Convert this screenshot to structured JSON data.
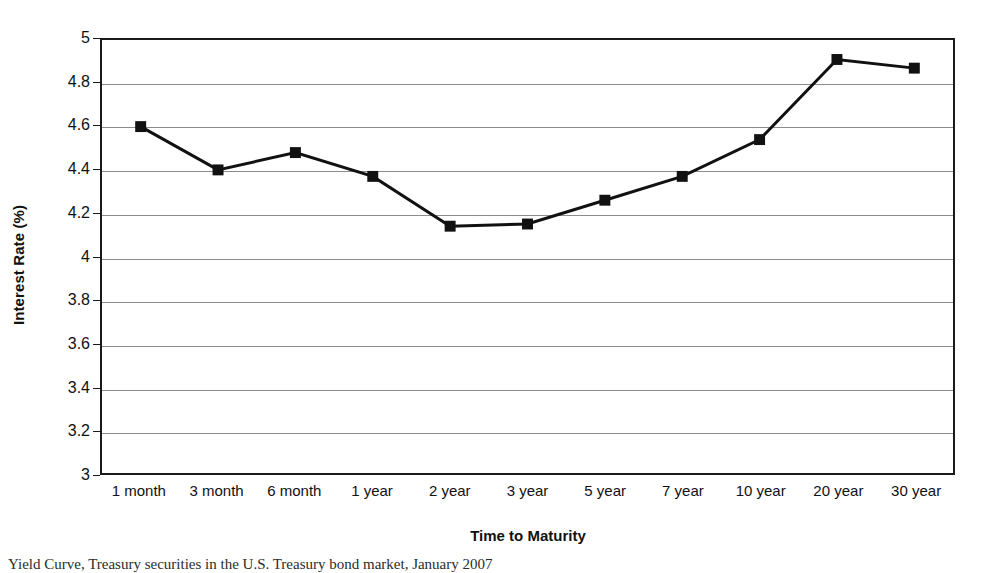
{
  "chart_data": {
    "type": "line",
    "title": "",
    "xlabel": "Time to Maturity",
    "ylabel": "Interest Rate (%)",
    "categories": [
      "1 month",
      "3 month",
      "6 month",
      "1 year",
      "2 year",
      "3 year",
      "5 year",
      "7 year",
      "10 year",
      "20 year",
      "30 year"
    ],
    "values": [
      4.6,
      4.4,
      4.48,
      4.37,
      4.14,
      4.15,
      4.26,
      4.37,
      4.54,
      4.91,
      4.87
    ],
    "series": [
      {
        "name": "Interest Rate",
        "values": [
          4.6,
          4.4,
          4.48,
          4.37,
          4.14,
          4.15,
          4.26,
          4.37,
          4.54,
          4.91,
          4.87
        ]
      }
    ],
    "ylim": [
      3,
      5
    ],
    "ytick_labels": [
      "5",
      "4.8",
      "4.6",
      "4.4",
      "4.2",
      "4",
      "3.8",
      "3.6",
      "3.4",
      "3.2",
      "3"
    ],
    "ytick_values": [
      5,
      4.8,
      4.6,
      4.4,
      4.2,
      4,
      3.8,
      3.6,
      3.4,
      3.2,
      3
    ],
    "ytick_step": 0.2,
    "grid": true,
    "grid_axis": "y",
    "legend": false,
    "legend_position": "none",
    "marker": "square",
    "marker_color": "#111111",
    "line_color": "#111111",
    "line_width": 3,
    "background_color": "#ffffff",
    "frame_color": "#1a1a1a"
  },
  "caption": {
    "text": "Yield Curve, Treasury securities in the U.S. Treasury bond market, January 2007",
    "note": "text is clipped at the bottom edge of the image"
  }
}
